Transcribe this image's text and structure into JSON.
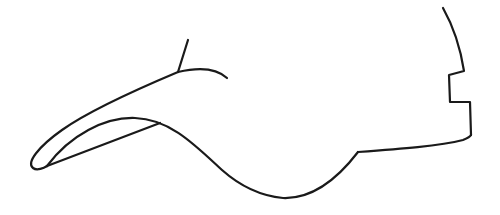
{
  "drawing": {
    "subject": "baseball cap side profile line drawing",
    "stroke_color": "#1a1a1a",
    "background_color": "#ffffff",
    "parts": [
      {
        "name": "brim-upper-edge",
        "label": "Brim upper edge"
      },
      {
        "name": "brim-inner-edge",
        "label": "Brim inner edge"
      },
      {
        "name": "brim-underside-curve",
        "label": "Brim underside and crown bottom curve"
      },
      {
        "name": "crown-seam",
        "label": "Crown seam"
      },
      {
        "name": "crown-top-curve",
        "label": "Crown top curve"
      },
      {
        "name": "back-strap-notch",
        "label": "Back strap notch"
      },
      {
        "name": "bottom-band",
        "label": "Bottom band"
      }
    ]
  }
}
